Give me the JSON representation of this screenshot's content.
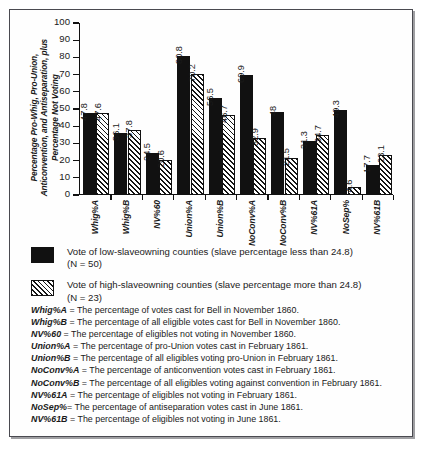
{
  "chart_data": {
    "type": "bar",
    "title": "",
    "xlabel": "",
    "ylabel": "Percentage Pro-Whig, Pro-Union, Anticonvention, and Antiseparation, plus Percentage Not Voting",
    "ylim": [
      0,
      100
    ],
    "ytick_labels": [
      "100",
      "90",
      "80",
      "70",
      "60",
      "50",
      "40",
      "30",
      "20",
      "10",
      "0"
    ],
    "ytick_values": [
      100,
      90,
      80,
      70,
      60,
      50,
      40,
      30,
      20,
      10,
      0
    ],
    "grid": false,
    "legend_position": "below-plot",
    "categories": [
      "Whig%A",
      "Whig%B",
      "NV%60",
      "Union%A",
      "Union%B",
      "NoConv%A",
      "NoConv%B",
      "NV%61A",
      "NoSep%",
      "NV%61B"
    ],
    "series": [
      {
        "name": "Vote of low-slaveowning counties (slave percentage less than 24.8)",
        "fill": "solid-black",
        "values": [
          47.8,
          36.1,
          24.5,
          80.8,
          56.5,
          69.9,
          48,
          31.3,
          49.3,
          17.7
        ],
        "labels": [
          "47.8",
          "36.1",
          "24.5",
          "80.8",
          "56.5",
          "69.9",
          "48",
          "31.3",
          "49.3",
          "17.7"
        ]
      },
      {
        "name": "Vote of high-slaveowning counties (slave percentage more than 24.8)",
        "fill": "diagonal-hatch",
        "values": [
          47.6,
          37.8,
          20.6,
          70.2,
          46.7,
          32.9,
          21.5,
          34.7,
          4.6,
          23.1
        ],
        "labels": [
          "47.6",
          "37.8",
          "20.6",
          "70.2",
          "46.7",
          "32.9",
          "21.5",
          "34.7",
          "4.6",
          "23.1"
        ]
      }
    ]
  },
  "legend": {
    "items": [
      {
        "swatch": "solid-black",
        "line1": "Vote of low-slaveowning counties (slave percentage less than 24.8)",
        "line2": "(N = 50)"
      },
      {
        "swatch": "diagonal-hatch",
        "line1": "Vote of high-slaveowning counties (slave percentage more than 24.8)",
        "line2": "(N = 23)"
      }
    ]
  },
  "footnotes": [
    {
      "key": "Whig%A",
      "text": " = The percentage of votes cast for Bell  in November 1860."
    },
    {
      "key": "Whig%B",
      "text": " = The percentage of all eligible votes cast for Bell  in November 1860."
    },
    {
      "key": "NV%60",
      "text": " = The percentage of eligibles not voting in November 1860."
    },
    {
      "key": "Union%A",
      "text": " = The percentage of  pro-Union votes cast in February 1861."
    },
    {
      "key": "Union%B",
      "text": " = The percentage of all eligibles voting pro-Union in February 1861."
    },
    {
      "key": "NoConv%A",
      "text": " = The percentage of anticonvention votes cast in February 1861."
    },
    {
      "key": "NoConv%B",
      "text": " = The percentage of all eligibles voting against convention in February 1861."
    },
    {
      "key": "NV%61A",
      "text": " = The percentage of eligibles not voting in February 1861."
    },
    {
      "key": "NoSep%",
      "text": "= The percentage of antiseparation votes cast in June 1861."
    },
    {
      "key": "NV%61B",
      "text": " = The percentage of eligibles not voting in June 1861."
    }
  ],
  "colors": {
    "series_low": "#111111",
    "series_high": "#ffffff",
    "frame": "#4a4a50",
    "axis": "#111111",
    "background": "#ffffff"
  }
}
